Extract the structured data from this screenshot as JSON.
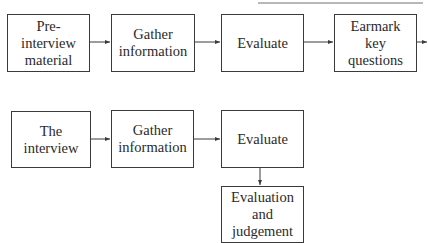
{
  "diagram": {
    "type": "flowchart",
    "header_fragment": "",
    "row1": {
      "nodes": [
        {
          "id": "pre-interview-material",
          "label": "Pre-interview\nmaterial"
        },
        {
          "id": "gather-information-1",
          "label": "Gather\ninformation"
        },
        {
          "id": "evaluate-1",
          "label": "Evaluate"
        },
        {
          "id": "earmark-key-questions",
          "label": "Earmark\nkey questions"
        }
      ]
    },
    "row2": {
      "nodes": [
        {
          "id": "the-interview",
          "label": "The interview"
        },
        {
          "id": "gather-information-2",
          "label": "Gather\ninformation"
        },
        {
          "id": "evaluate-2",
          "label": "Evaluate"
        },
        {
          "id": "evaluation-and-judgement",
          "label": "Evaluation and\njudgement"
        }
      ]
    },
    "edges": [
      {
        "from": "pre-interview-material",
        "to": "gather-information-1"
      },
      {
        "from": "gather-information-1",
        "to": "evaluate-1"
      },
      {
        "from": "evaluate-1",
        "to": "earmark-key-questions"
      },
      {
        "from": "earmark-key-questions",
        "to": "off-page-right"
      },
      {
        "from": "the-interview",
        "to": "gather-information-2"
      },
      {
        "from": "gather-information-2",
        "to": "evaluate-2"
      },
      {
        "from": "evaluate-2",
        "to": "evaluation-and-judgement"
      }
    ],
    "colors": {
      "stroke": "#3a3a3a",
      "text": "#2a2a2a",
      "background": "#ffffff"
    }
  }
}
